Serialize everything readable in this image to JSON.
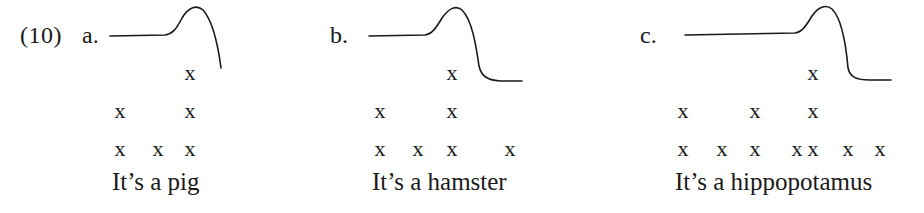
{
  "example_number": "(10)",
  "panels": [
    {
      "label": "a.",
      "label_x": 82,
      "sentence": "It’s a pig",
      "sentence_x": 112,
      "contour_path": "M110,36 L165,35 C172,34 176,30 182,18 C188,8 196,4 203,10 C212,20 218,45 221,68",
      "grid": {
        "row_top": [
          {
            "x": 190,
            "mark": "x"
          }
        ],
        "row_mid": [
          {
            "x": 120,
            "mark": "x"
          },
          {
            "x": 190,
            "mark": "x"
          }
        ],
        "row_base": [
          {
            "x": 120,
            "mark": "x"
          },
          {
            "x": 158,
            "mark": "x"
          },
          {
            "x": 190,
            "mark": "x"
          }
        ]
      }
    },
    {
      "label": "b.",
      "label_x": 330,
      "sentence": "It’s a hamster",
      "sentence_x": 372,
      "contour_path": "M369,36 L425,35 C432,34 436,28 442,18 C449,8 456,5 462,10 C472,20 476,45 479,66 C481,75 486,80 500,81 L522,81",
      "grid": {
        "row_top": [
          {
            "x": 452,
            "mark": "x"
          }
        ],
        "row_mid": [
          {
            "x": 380,
            "mark": "x"
          },
          {
            "x": 452,
            "mark": "x"
          }
        ],
        "row_base": [
          {
            "x": 380,
            "mark": "x"
          },
          {
            "x": 418,
            "mark": "x"
          },
          {
            "x": 452,
            "mark": "x"
          },
          {
            "x": 510,
            "mark": "x"
          }
        ]
      }
    },
    {
      "label": "c.",
      "label_x": 640,
      "sentence": "It’s a hippopotamus",
      "sentence_x": 675,
      "contour_path": "M685,35 L795,33 C802,32 806,26 812,16 C818,7 826,4 832,9 C842,19 846,45 848,68 C850,77 856,80 870,80 L891,80",
      "grid": {
        "row_top": [
          {
            "x": 813,
            "mark": "x"
          }
        ],
        "row_mid": [
          {
            "x": 683,
            "mark": "x"
          },
          {
            "x": 755,
            "mark": "x"
          },
          {
            "x": 813,
            "mark": "x"
          }
        ],
        "row_base": [
          {
            "x": 683,
            "mark": "x"
          },
          {
            "x": 722,
            "mark": "x"
          },
          {
            "x": 755,
            "mark": "x"
          },
          {
            "x": 797,
            "mark": "x"
          },
          {
            "x": 813,
            "mark": "x"
          },
          {
            "x": 848,
            "mark": "x"
          },
          {
            "x": 880,
            "mark": "x"
          }
        ]
      }
    }
  ],
  "row_y": {
    "row_top": 62,
    "row_mid": 100,
    "row_base": 138
  }
}
